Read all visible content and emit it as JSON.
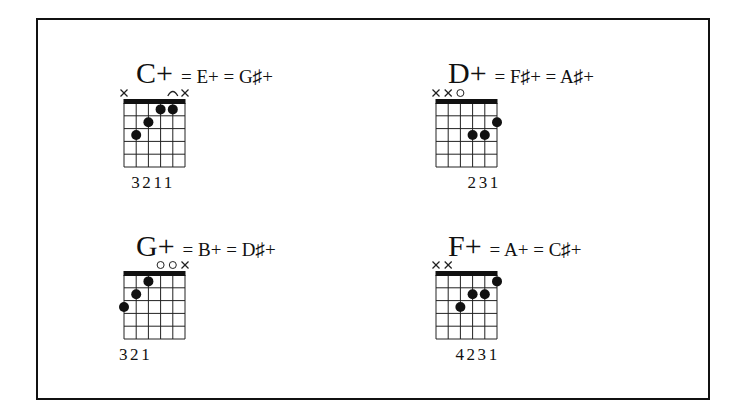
{
  "diagram": {
    "type": "guitar-chord-chart",
    "strings": 6,
    "frets_shown": 5,
    "chords": [
      {
        "name": "C+",
        "equivalents": "= E+ = G♯+",
        "string_markers": [
          "x",
          "",
          "",
          "",
          "arc",
          "x"
        ],
        "dots": [
          {
            "string": 2,
            "fret": 3
          },
          {
            "string": 3,
            "fret": 2
          },
          {
            "string": 4,
            "fret": 1
          },
          {
            "string": 5,
            "fret": 1
          }
        ],
        "fingering": "3211",
        "fingering_start_string": 2
      },
      {
        "name": "D+",
        "equivalents": "= F♯+ = A♯+",
        "string_markers": [
          "x",
          "x",
          "o",
          "",
          "",
          ""
        ],
        "dots": [
          {
            "string": 4,
            "fret": 3
          },
          {
            "string": 5,
            "fret": 3
          },
          {
            "string": 6,
            "fret": 2
          }
        ],
        "fingering": "231",
        "fingering_start_string": 4
      },
      {
        "name": "G+",
        "equivalents": "= B+ = D♯+",
        "string_markers": [
          "",
          "",
          "",
          "o",
          "o",
          "x"
        ],
        "dots": [
          {
            "string": 1,
            "fret": 3
          },
          {
            "string": 2,
            "fret": 2
          },
          {
            "string": 3,
            "fret": 1
          }
        ],
        "fingering": "321",
        "fingering_start_string": 1
      },
      {
        "name": "F+",
        "equivalents": "= A+ = C♯+",
        "string_markers": [
          "x",
          "x",
          "",
          "",
          "",
          ""
        ],
        "dots": [
          {
            "string": 3,
            "fret": 3
          },
          {
            "string": 4,
            "fret": 2
          },
          {
            "string": 5,
            "fret": 2
          },
          {
            "string": 6,
            "fret": 1
          }
        ],
        "fingering": "4231",
        "fingering_start_string": 3
      }
    ]
  },
  "layout_positions": [
    {
      "title_x": 136,
      "title_y": 58,
      "grid_x": 124,
      "grid_y": 103
    },
    {
      "title_x": 448,
      "title_y": 58,
      "grid_x": 436,
      "grid_y": 103
    },
    {
      "title_x": 136,
      "title_y": 231,
      "grid_x": 124,
      "grid_y": 275
    },
    {
      "title_x": 448,
      "title_y": 231,
      "grid_x": 436,
      "grid_y": 275
    }
  ]
}
